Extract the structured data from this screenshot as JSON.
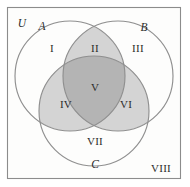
{
  "figure": {
    "universe_label": "U",
    "background_color": "#ffffff",
    "panel_color": "#fdfdfc",
    "border_color": "#8c8c8c",
    "stroke_color": "#8f8f8f",
    "text_color": "#2b2b2b",
    "shade_light": "#d4d4d4",
    "shade_dark": "#b4b4b4"
  },
  "sets": [
    {
      "id": "A",
      "label": "A",
      "cx": 70,
      "cy": 76,
      "r": 55,
      "lx": 42,
      "ly": 26
    },
    {
      "id": "B",
      "label": "B",
      "cx": 118,
      "cy": 76,
      "r": 55,
      "lx": 144,
      "ly": 27
    },
    {
      "id": "C",
      "label": "C",
      "cx": 94,
      "cy": 111,
      "r": 55,
      "lx": 95,
      "ly": 164
    }
  ],
  "regions": [
    {
      "id": "I",
      "label": "I",
      "x": 52,
      "y": 48,
      "shade": "none",
      "desc": "A only"
    },
    {
      "id": "II",
      "label": "II",
      "x": 95,
      "y": 48,
      "shade": "light",
      "desc": "A and B only"
    },
    {
      "id": "III",
      "label": "III",
      "x": 138,
      "y": 48,
      "shade": "none",
      "desc": "B only"
    },
    {
      "id": "IV",
      "label": "IV",
      "x": 66,
      "y": 104,
      "shade": "light",
      "desc": "A and C only"
    },
    {
      "id": "V",
      "label": "V",
      "x": 95,
      "y": 87,
      "shade": "dark",
      "desc": "A and B and C"
    },
    {
      "id": "VI",
      "label": "VI",
      "x": 126,
      "y": 104,
      "shade": "light",
      "desc": "B and C only"
    },
    {
      "id": "VII",
      "label": "VII",
      "x": 95,
      "y": 141,
      "shade": "none",
      "desc": "C only"
    },
    {
      "id": "VIII",
      "label": "VIII",
      "x": 161,
      "y": 168,
      "shade": "none",
      "desc": "outside all sets"
    }
  ],
  "panel": {
    "x": 7,
    "y": 7,
    "width": 173,
    "height": 171
  },
  "universe": {
    "label": "U",
    "x": 22,
    "y": 23
  }
}
